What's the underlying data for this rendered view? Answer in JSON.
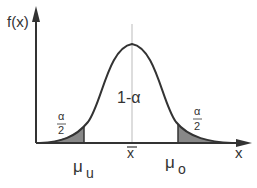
{
  "diagram": {
    "type": "normal-distribution-confidence-interval",
    "y_axis_label": "f(x)",
    "x_axis_label": "x",
    "center_label": "x̄",
    "center_area_label": "1-α",
    "left_tail": {
      "numerator": "α",
      "denominator": "2"
    },
    "right_tail": {
      "numerator": "α",
      "denominator": "2"
    },
    "lower_bound": {
      "symbol": "μ",
      "subscript": "u"
    },
    "upper_bound": {
      "symbol": "μ",
      "subscript": "o"
    },
    "colors": {
      "line": "#333333",
      "tail_fill": "#888888",
      "mean_line": "#bbbbbb",
      "background": "#ffffff"
    }
  }
}
